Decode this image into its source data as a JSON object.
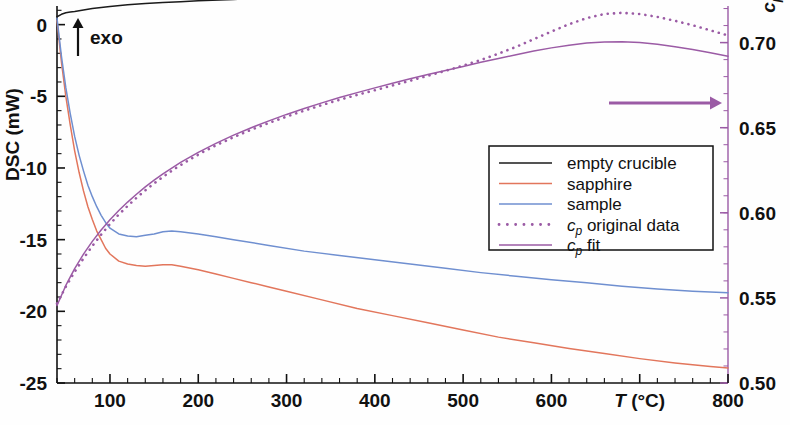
{
  "figure": {
    "background": "#fefefe",
    "exo_label": "exo",
    "exo_arrow_icon": "up-arrow-icon",
    "right_axis_arrow_icon": "right-arrow-icon"
  },
  "axes": {
    "left": {
      "title": "DSC (mW)",
      "ticks": [
        "0",
        "-5",
        "-10",
        "-15",
        "-20",
        "-25"
      ],
      "tick_values": [
        0,
        -5,
        -10,
        -15,
        -20,
        -25
      ],
      "range": [
        -25,
        1.3
      ],
      "color": "#111111"
    },
    "right": {
      "title_main": "c",
      "title_sub": "p",
      "title_unit": " (J/(g·K))",
      "title": "c_p (J/(g·K))",
      "ticks": [
        "0.70",
        "0.65",
        "0.60",
        "0.55",
        "0.50"
      ],
      "tick_values": [
        0.7,
        0.65,
        0.6,
        0.55,
        0.5
      ],
      "range": [
        0.5,
        0.7215
      ],
      "color": "#9b5ba5"
    },
    "bottom": {
      "title_main": "T",
      "title_unit": " (°C)",
      "title": "T (°C)",
      "ticks": [
        "100",
        "200",
        "300",
        "400",
        "500",
        "600",
        "800"
      ],
      "tick_values": [
        100,
        200,
        300,
        400,
        500,
        600,
        800
      ],
      "label_inline_at": 700,
      "range": [
        40,
        800
      ],
      "minor_step": 20,
      "color": "#111111"
    }
  },
  "legend": {
    "items": [
      {
        "label": "empty crucible",
        "color": "#1b1b1b",
        "style": "solid",
        "swatch": "line-swatch"
      },
      {
        "label": "sapphire",
        "color": "#e2765c",
        "style": "solid",
        "swatch": "line-swatch"
      },
      {
        "label": "sample",
        "color": "#6f8fd0",
        "style": "solid",
        "swatch": "line-swatch"
      },
      {
        "label": "c_p original data",
        "label_main": "c",
        "label_sub": "p",
        "label_rest": " original data",
        "color": "#9b5ba5",
        "style": "dotted",
        "swatch": "dotted-swatch"
      },
      {
        "label": "c_p fit",
        "label_main": "c",
        "label_sub": "p",
        "label_rest": " fit",
        "color": "#9b5ba5",
        "style": "solid",
        "swatch": "line-swatch"
      }
    ]
  },
  "chart_data": {
    "type": "line",
    "title": "",
    "xlabel": "T (°C)",
    "ylabel": "DSC (mW)",
    "ylabel_right": "c_p (J/(g·K))",
    "xlim": [
      40,
      800
    ],
    "ylim": [
      -25,
      1.3
    ],
    "ylim_right": [
      0.5,
      0.7215
    ],
    "grid": false,
    "legend_position": "center-right",
    "annotations": [
      {
        "text": "exo",
        "type": "up-arrow",
        "x": 75,
        "y": 1.0
      },
      {
        "text": "",
        "type": "right-arrow",
        "note": "cp curves read on right axis",
        "x_from": 610,
        "x_to": 800
      }
    ],
    "series": [
      {
        "name": "empty crucible",
        "axis": "left",
        "color": "#1b1b1b",
        "style": "solid",
        "x": [
          40,
          45,
          50,
          55,
          60,
          70,
          80,
          90,
          100,
          120,
          140,
          160,
          180,
          200,
          240,
          280,
          320,
          360,
          400,
          440,
          480,
          520,
          560,
          600,
          640,
          680,
          720,
          760,
          800
        ],
        "y": [
          0.55,
          0.72,
          0.83,
          0.88,
          0.92,
          1.02,
          1.12,
          1.2,
          1.27,
          1.38,
          1.47,
          1.54,
          1.6,
          1.66,
          1.76,
          1.85,
          1.93,
          2.01,
          2.09,
          2.17,
          2.26,
          2.35,
          2.44,
          2.53,
          2.62,
          2.71,
          2.8,
          2.89,
          2.97
        ]
      },
      {
        "name": "sapphire",
        "axis": "left",
        "color": "#e2765c",
        "style": "solid",
        "x": [
          40,
          45,
          50,
          55,
          60,
          65,
          70,
          75,
          80,
          85,
          90,
          95,
          100,
          110,
          120,
          130,
          140,
          150,
          160,
          170,
          180,
          200,
          220,
          240,
          260,
          280,
          300,
          340,
          380,
          420,
          460,
          500,
          540,
          580,
          620,
          660,
          700,
          740,
          780,
          800
        ],
        "y": [
          0.3,
          -2.6,
          -5.0,
          -7.0,
          -8.8,
          -10.3,
          -11.6,
          -12.7,
          -13.6,
          -14.4,
          -15.0,
          -15.6,
          -16.0,
          -16.5,
          -16.7,
          -16.8,
          -16.85,
          -16.8,
          -16.75,
          -16.75,
          -16.85,
          -17.1,
          -17.4,
          -17.7,
          -18.0,
          -18.3,
          -18.6,
          -19.2,
          -19.8,
          -20.3,
          -20.8,
          -21.3,
          -21.8,
          -22.2,
          -22.6,
          -22.95,
          -23.3,
          -23.6,
          -23.85,
          -23.95
        ]
      },
      {
        "name": "sample",
        "axis": "left",
        "color": "#6f8fd0",
        "style": "solid",
        "x": [
          40,
          45,
          50,
          55,
          60,
          65,
          70,
          75,
          80,
          85,
          90,
          95,
          100,
          110,
          120,
          130,
          140,
          150,
          160,
          170,
          180,
          200,
          220,
          240,
          280,
          320,
          360,
          400,
          440,
          480,
          520,
          560,
          600,
          640,
          680,
          720,
          760,
          800
        ],
        "y": [
          0.45,
          -2.2,
          -4.4,
          -6.2,
          -7.8,
          -9.1,
          -10.2,
          -11.2,
          -12.0,
          -12.7,
          -13.3,
          -13.8,
          -14.2,
          -14.6,
          -14.75,
          -14.8,
          -14.7,
          -14.6,
          -14.45,
          -14.4,
          -14.45,
          -14.6,
          -14.8,
          -15.0,
          -15.4,
          -15.8,
          -16.1,
          -16.4,
          -16.7,
          -17.0,
          -17.3,
          -17.55,
          -17.8,
          -18.0,
          -18.25,
          -18.45,
          -18.6,
          -18.7
        ]
      },
      {
        "name": "c_p original data",
        "axis": "right",
        "color": "#9b5ba5",
        "style": "dotted",
        "x": [
          40,
          50,
          60,
          70,
          80,
          90,
          100,
          110,
          120,
          130,
          140,
          150,
          160,
          175,
          190,
          205,
          220,
          240,
          260,
          280,
          300,
          320,
          340,
          360,
          380,
          400,
          420,
          440,
          460,
          480,
          500,
          520,
          540,
          560,
          580,
          600,
          620,
          640,
          660,
          680,
          700,
          720,
          740,
          760,
          780,
          800
        ],
        "y": [
          0.5467,
          0.5566,
          0.5653,
          0.5732,
          0.5805,
          0.5872,
          0.5934,
          0.599,
          0.604,
          0.6088,
          0.6132,
          0.6173,
          0.6211,
          0.6264,
          0.6312,
          0.6356,
          0.6396,
          0.6444,
          0.6488,
          0.6528,
          0.6565,
          0.66,
          0.6633,
          0.6664,
          0.6693,
          0.672,
          0.6748,
          0.6776,
          0.6805,
          0.6834,
          0.6865,
          0.6898,
          0.6935,
          0.6975,
          0.702,
          0.7065,
          0.7108,
          0.7144,
          0.7168,
          0.7175,
          0.7168,
          0.7151,
          0.7128,
          0.7102,
          0.7072,
          0.7042
        ]
      },
      {
        "name": "c_p fit",
        "axis": "right",
        "color": "#9b5ba5",
        "style": "solid",
        "x": [
          40,
          50,
          60,
          70,
          80,
          90,
          100,
          110,
          120,
          130,
          140,
          150,
          160,
          180,
          200,
          220,
          240,
          260,
          280,
          300,
          320,
          340,
          360,
          380,
          400,
          420,
          440,
          460,
          480,
          500,
          520,
          540,
          560,
          580,
          600,
          620,
          640,
          660,
          680,
          700,
          720,
          740,
          760,
          780,
          800
        ],
        "y": [
          0.5455,
          0.5573,
          0.5672,
          0.5757,
          0.5832,
          0.5899,
          0.5959,
          0.6013,
          0.6063,
          0.6109,
          0.6152,
          0.6192,
          0.6229,
          0.6296,
          0.6355,
          0.6408,
          0.6456,
          0.65,
          0.654,
          0.6578,
          0.6613,
          0.6646,
          0.6677,
          0.6706,
          0.6734,
          0.6761,
          0.6787,
          0.6812,
          0.6836,
          0.686,
          0.6884,
          0.6907,
          0.6929,
          0.695,
          0.6969,
          0.6985,
          0.6997,
          0.7004,
          0.7005,
          0.7,
          0.699,
          0.6976,
          0.6959,
          0.694,
          0.692
        ]
      }
    ]
  }
}
